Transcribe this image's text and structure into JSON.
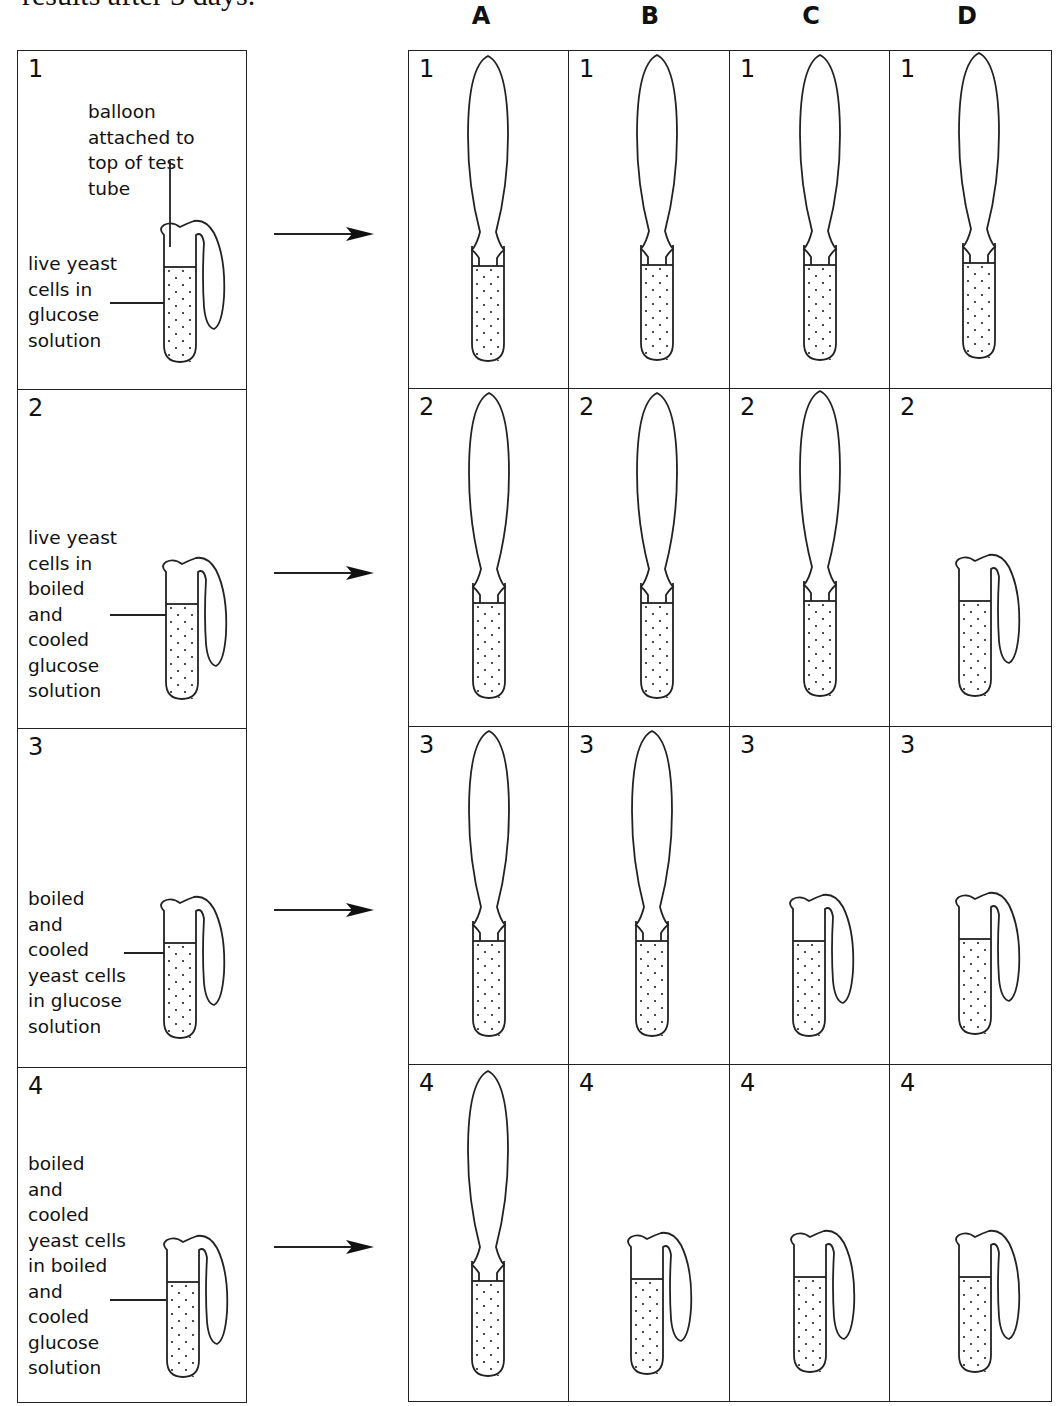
{
  "intro_text": "results after 3 days.",
  "columns": [
    "A",
    "B",
    "C",
    "D"
  ],
  "setups": [
    {
      "number": "1",
      "balloon_label": [
        "balloon",
        "attached to",
        "top of test",
        "tube"
      ],
      "label": [
        "live yeast",
        "cells in",
        "glucose",
        "solution"
      ]
    },
    {
      "number": "2",
      "label": [
        "live yeast",
        "cells in",
        "boiled",
        "and",
        "cooled",
        "glucose",
        "solution"
      ]
    },
    {
      "number": "3",
      "label": [
        "boiled",
        "and",
        "cooled",
        "yeast cells",
        "in glucose",
        "solution"
      ]
    },
    {
      "number": "4",
      "label": [
        "boiled",
        "and",
        "cooled",
        "yeast cells",
        "in boiled",
        "and",
        "cooled",
        "glucose",
        "solution"
      ]
    }
  ],
  "results": {
    "A": {
      "1": "inflated",
      "2": "inflated",
      "3": "inflated",
      "4": "inflated"
    },
    "B": {
      "1": "inflated",
      "2": "inflated",
      "3": "inflated",
      "4": "deflated"
    },
    "C": {
      "1": "inflated",
      "2": "inflated",
      "3": "deflated",
      "4": "deflated"
    },
    "D": {
      "1": "inflated",
      "2": "deflated",
      "3": "deflated",
      "4": "deflated"
    }
  },
  "cell_numbers": [
    "1",
    "2",
    "3",
    "4"
  ]
}
